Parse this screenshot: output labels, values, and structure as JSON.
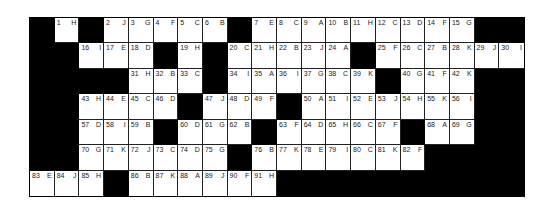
{
  "puzzle": {
    "columns": 20,
    "rows": 7,
    "colors": {
      "block": "#000000",
      "cell": "#ffffff",
      "text": "#222222"
    },
    "grid": [
      [
        null,
        {
          "n": "1",
          "l": "H"
        },
        null,
        {
          "n": "2",
          "l": "J"
        },
        {
          "n": "3",
          "l": "G"
        },
        {
          "n": "4",
          "l": "F"
        },
        {
          "n": "5",
          "l": "C"
        },
        {
          "n": "6",
          "l": "B"
        },
        null,
        {
          "n": "7",
          "l": "E"
        },
        {
          "n": "8",
          "l": "C"
        },
        {
          "n": "9",
          "l": "A"
        },
        {
          "n": "10",
          "l": "B"
        },
        {
          "n": "11",
          "l": "H"
        },
        {
          "n": "12",
          "l": "C"
        },
        {
          "n": "13",
          "l": "D"
        },
        {
          "n": "14",
          "l": "F"
        },
        {
          "n": "15",
          "l": "G"
        },
        null,
        null
      ],
      [
        null,
        null,
        {
          "n": "16",
          "l": "I"
        },
        {
          "n": "17",
          "l": "E"
        },
        {
          "n": "18",
          "l": "D"
        },
        null,
        {
          "n": "19",
          "l": "H"
        },
        null,
        {
          "n": "20",
          "l": "C"
        },
        {
          "n": "21",
          "l": "H"
        },
        {
          "n": "22",
          "l": "B"
        },
        {
          "n": "23",
          "l": "J"
        },
        {
          "n": "24",
          "l": "A"
        },
        null,
        {
          "n": "25",
          "l": "F"
        },
        {
          "n": "26",
          "l": "C"
        },
        {
          "n": "27",
          "l": "B"
        },
        {
          "n": "28",
          "l": "K"
        },
        {
          "n": "29",
          "l": "J"
        },
        {
          "n": "30",
          "l": "I"
        }
      ],
      [
        null,
        null,
        null,
        null,
        {
          "n": "31",
          "l": "H"
        },
        {
          "n": "32",
          "l": "B"
        },
        {
          "n": "33",
          "l": "C"
        },
        null,
        {
          "n": "34",
          "l": "I"
        },
        {
          "n": "35",
          "l": "A"
        },
        {
          "n": "36",
          "l": "I"
        },
        {
          "n": "37",
          "l": "G"
        },
        {
          "n": "38",
          "l": "C"
        },
        {
          "n": "39",
          "l": "K"
        },
        null,
        {
          "n": "40",
          "l": "G"
        },
        {
          "n": "41",
          "l": "F"
        },
        {
          "n": "42",
          "l": "K"
        },
        null,
        null
      ],
      [
        null,
        null,
        {
          "n": "43",
          "l": "H"
        },
        {
          "n": "44",
          "l": "E"
        },
        {
          "n": "45",
          "l": "C"
        },
        {
          "n": "46",
          "l": "D"
        },
        null,
        {
          "n": "47",
          "l": "J"
        },
        {
          "n": "48",
          "l": "D"
        },
        {
          "n": "49",
          "l": "F"
        },
        null,
        {
          "n": "50",
          "l": "A"
        },
        {
          "n": "51",
          "l": "I"
        },
        {
          "n": "52",
          "l": "E"
        },
        {
          "n": "53",
          "l": "J"
        },
        {
          "n": "54",
          "l": "H"
        },
        {
          "n": "55",
          "l": "K"
        },
        {
          "n": "56",
          "l": "I"
        },
        null,
        null
      ],
      [
        null,
        null,
        {
          "n": "57",
          "l": "D"
        },
        {
          "n": "58",
          "l": "I"
        },
        {
          "n": "59",
          "l": "B"
        },
        null,
        {
          "n": "60",
          "l": "D"
        },
        {
          "n": "61",
          "l": "G"
        },
        {
          "n": "62",
          "l": "B"
        },
        null,
        {
          "n": "63",
          "l": "F"
        },
        {
          "n": "64",
          "l": "D"
        },
        {
          "n": "65",
          "l": "H"
        },
        {
          "n": "66",
          "l": "C"
        },
        {
          "n": "67",
          "l": "F"
        },
        null,
        {
          "n": "68",
          "l": "A"
        },
        {
          "n": "69",
          "l": "G"
        },
        null,
        null
      ],
      [
        null,
        null,
        {
          "n": "70",
          "l": "G"
        },
        {
          "n": "71",
          "l": "K"
        },
        {
          "n": "72",
          "l": "J"
        },
        {
          "n": "73",
          "l": "C"
        },
        {
          "n": "74",
          "l": "D"
        },
        {
          "n": "75",
          "l": "G"
        },
        null,
        {
          "n": "76",
          "l": "B"
        },
        {
          "n": "77",
          "l": "K"
        },
        {
          "n": "78",
          "l": "E"
        },
        {
          "n": "79",
          "l": "I"
        },
        {
          "n": "80",
          "l": "C"
        },
        {
          "n": "81",
          "l": "K"
        },
        {
          "n": "82",
          "l": "F"
        },
        null,
        null,
        null,
        null
      ],
      [
        {
          "n": "83",
          "l": "E"
        },
        {
          "n": "84",
          "l": "J"
        },
        {
          "n": "85",
          "l": "H"
        },
        null,
        {
          "n": "86",
          "l": "B"
        },
        {
          "n": "87",
          "l": "K"
        },
        {
          "n": "88",
          "l": "A"
        },
        {
          "n": "89",
          "l": "J"
        },
        {
          "n": "90",
          "l": "F"
        },
        {
          "n": "91",
          "l": "H"
        },
        null,
        null,
        null,
        null,
        null,
        null,
        null,
        null,
        null,
        null
      ]
    ]
  }
}
